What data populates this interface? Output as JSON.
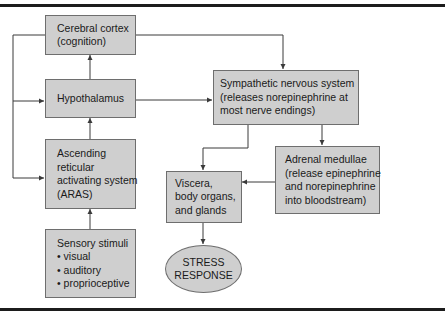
{
  "figure": {
    "caption_fragment": "...physiologic..."
  },
  "nodes": {
    "cortex": {
      "lines": [
        "Cerebral cortex",
        "(cognition)"
      ]
    },
    "hypothalamus": {
      "lines": [
        "Hypothalamus"
      ]
    },
    "aras": {
      "lines": [
        "Ascending",
        "reticular",
        "activating system",
        "(ARAS)"
      ]
    },
    "sensory": {
      "lines": [
        "Sensory stimuli",
        "• visual",
        "• auditory",
        "• proprioceptive"
      ]
    },
    "sympathetic": {
      "lines": [
        "Sympathetic nervous system",
        "(releases norepinephrine at",
        "most nerve endings)"
      ]
    },
    "adrenal": {
      "lines": [
        "Adrenal medullae",
        "(release epinephrine",
        "and norepinephrine",
        "into bloodstream)"
      ]
    },
    "viscera": {
      "lines": [
        "Viscera,",
        "body organs,",
        "and glands"
      ]
    },
    "stress": {
      "lines": [
        "STRESS",
        "RESPONSE"
      ]
    }
  },
  "colors": {
    "box_fill": "#cfcfcf",
    "box_border": "#6e6e6e",
    "line": "#3a3a3a",
    "rule": "#1c1c1c"
  },
  "edges": [
    {
      "from": "sensory",
      "to": "aras"
    },
    {
      "from": "aras",
      "to": "hypothalamus"
    },
    {
      "from": "hypothalamus",
      "to": "cortex"
    },
    {
      "from": "cortex",
      "to": "sympathetic"
    },
    {
      "from": "hypothalamus",
      "to": "sympathetic"
    },
    {
      "from": "cortex",
      "to": "hypothalamus",
      "via": "left feedback"
    },
    {
      "from": "cortex",
      "to": "aras",
      "via": "left feedback"
    },
    {
      "from": "sympathetic",
      "to": "viscera"
    },
    {
      "from": "sympathetic",
      "to": "adrenal"
    },
    {
      "from": "adrenal",
      "to": "viscera"
    },
    {
      "from": "viscera",
      "to": "stress"
    }
  ]
}
